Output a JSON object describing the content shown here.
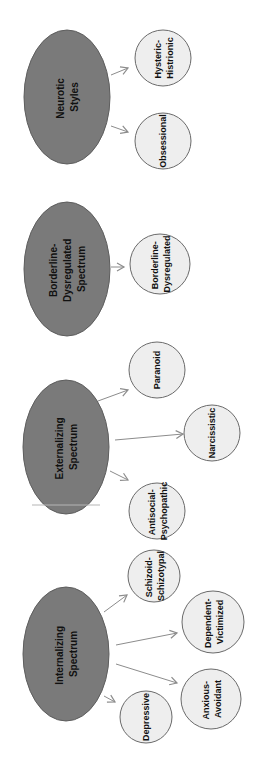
{
  "colors": {
    "parent_fill": "#7a7a7a",
    "parent_stroke": "#5e5e5e",
    "child_fill": "#eeeeee",
    "child_stroke": "#6a6a6a",
    "arrow": "#8c8c8c",
    "text": "#111111"
  },
  "groups": [
    {
      "id": "neurotic",
      "parent": {
        "lines": [
          "Neurotic",
          "Styles"
        ]
      },
      "children": [
        {
          "lines": [
            "Hysteric-",
            "Histrionic"
          ]
        },
        {
          "lines": [
            "Obsessional"
          ]
        }
      ]
    },
    {
      "id": "borderline",
      "parent": {
        "lines": [
          "Borderline-",
          "Dysregulated",
          "Spectrum"
        ]
      },
      "children": [
        {
          "lines": [
            "Borderline-",
            "Dysregulated"
          ]
        }
      ]
    },
    {
      "id": "externalizing",
      "parent": {
        "lines": [
          "Externalizing",
          "Spectrum"
        ]
      },
      "children": [
        {
          "lines": [
            "Paranoid"
          ]
        },
        {
          "lines": [
            "Narcissistic"
          ]
        },
        {
          "lines": [
            "Antisocial-",
            "Psychopathic"
          ]
        }
      ]
    },
    {
      "id": "internalizing",
      "parent": {
        "lines": [
          "Internalizing",
          "Spectrum"
        ]
      },
      "children": [
        {
          "lines": [
            "Schizoid-",
            "Schizotypal"
          ]
        },
        {
          "lines": [
            "Dependent-",
            "Victimized"
          ]
        },
        {
          "lines": [
            "Anxious-",
            "Avoidant"
          ]
        },
        {
          "lines": [
            "Depressive"
          ]
        }
      ]
    }
  ]
}
